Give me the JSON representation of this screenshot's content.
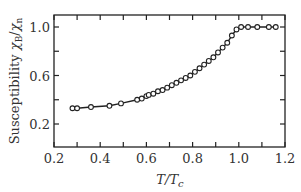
{
  "chart_data": {
    "type": "line",
    "title": "",
    "xlabel": "T/T_c",
    "ylabel": "Susceptibility χ_B/χ_n",
    "xlim": [
      0.2,
      1.2
    ],
    "ylim": [
      0.1,
      1.1
    ],
    "x_ticks": [
      0.2,
      0.4,
      0.6,
      0.8,
      1.0,
      1.2
    ],
    "x_minor_ticks": [
      0.3,
      0.5,
      0.7,
      0.9,
      1.1
    ],
    "y_ticks": [
      0.2,
      0.6,
      1.0
    ],
    "y_minor_ticks": [
      0.4,
      0.8
    ],
    "x_tick_labels": [
      "0.2",
      "0.4",
      "0.6",
      "0.8",
      "1.0",
      "1.2"
    ],
    "y_tick_labels": [
      "0.2",
      "0.6",
      "1.0"
    ],
    "grid": false,
    "legend": null,
    "series": [
      {
        "name": "measured",
        "marker": "open-circle",
        "line": "solid",
        "x": [
          0.28,
          0.3,
          0.36,
          0.44,
          0.49,
          0.56,
          0.58,
          0.6,
          0.61,
          0.63,
          0.65,
          0.67,
          0.69,
          0.71,
          0.73,
          0.75,
          0.77,
          0.79,
          0.81,
          0.83,
          0.85,
          0.87,
          0.89,
          0.91,
          0.93,
          0.95,
          0.97,
          0.99,
          1.01,
          1.04,
          1.08,
          1.13,
          1.16
        ],
        "y": [
          0.33,
          0.33,
          0.34,
          0.35,
          0.37,
          0.4,
          0.41,
          0.43,
          0.44,
          0.45,
          0.47,
          0.48,
          0.5,
          0.52,
          0.54,
          0.56,
          0.58,
          0.6,
          0.63,
          0.66,
          0.69,
          0.72,
          0.75,
          0.79,
          0.83,
          0.87,
          0.93,
          0.98,
          1.0,
          1.0,
          1.0,
          1.0,
          1.0
        ]
      }
    ]
  }
}
